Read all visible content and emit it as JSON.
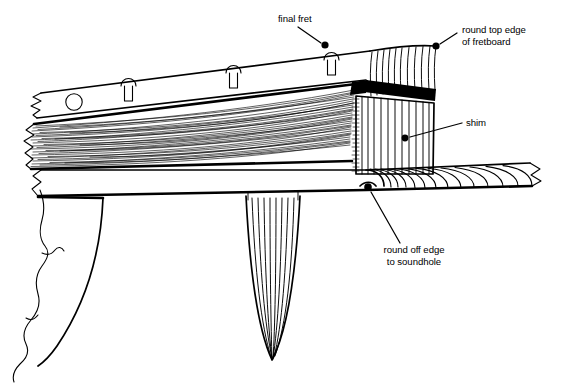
{
  "figure": {
    "view": "side elevation cutaway",
    "background_color": "#ffffff",
    "ink_color": "#000000",
    "width": 562,
    "height": 385
  },
  "callouts": [
    {
      "id": "final-fret",
      "label": "final fret",
      "lines": [
        "final fret"
      ],
      "text_x": 278,
      "text_y": 22,
      "anchor": "start",
      "leader": {
        "x1": 298,
        "y1": 27,
        "x2": 321,
        "y2": 43
      },
      "dot": {
        "cx": 325,
        "cy": 45,
        "r": 3.6
      }
    },
    {
      "id": "round-top-edge-of-fretboard",
      "label": "round top edge of fretboard",
      "lines": [
        "round top edge",
        "of fretboard"
      ],
      "text_x": 462,
      "text_y": 33,
      "anchor": "start",
      "leader": {
        "x1": 457,
        "y1": 33,
        "x2": 440,
        "y2": 44
      },
      "dot": {
        "cx": 436,
        "cy": 46,
        "r": 3.6
      }
    },
    {
      "id": "shim",
      "label": "shim",
      "lines": [
        "shim"
      ],
      "text_x": 466,
      "text_y": 126,
      "anchor": "start",
      "leader": {
        "x1": 462,
        "y1": 123,
        "x2": 410,
        "y2": 137
      },
      "dot": {
        "cx": 405,
        "cy": 138,
        "r": 3.4
      }
    },
    {
      "id": "round-off-edge-to-soundhole",
      "label": "round off edge to soundhole",
      "lines": [
        "round off edge",
        "to soundhole"
      ],
      "text_x": 414,
      "text_y": 253,
      "anchor": "middle",
      "leader": {
        "x1": 400,
        "y1": 243,
        "x2": 371,
        "y2": 192
      },
      "dot": {
        "cx": 368,
        "cy": 187,
        "r": 3.8
      }
    }
  ],
  "parts": [
    {
      "id": "neck-shaft",
      "name": "neck shaft with horizontal grain"
    },
    {
      "id": "fretboard",
      "name": "fretboard"
    },
    {
      "id": "frets",
      "name": "frets",
      "count": 3
    },
    {
      "id": "fret-marker-dot",
      "name": "side position marker dot"
    },
    {
      "id": "fretboard-end",
      "name": "rounded fretboard end grain"
    },
    {
      "id": "shim-block",
      "name": "shim block under fretboard extension"
    },
    {
      "id": "soundboard",
      "name": "soundboard / top"
    },
    {
      "id": "brace",
      "name": "tapered transverse brace"
    },
    {
      "id": "heel",
      "name": "neck heel profile"
    },
    {
      "id": "break-lines",
      "name": "break lines",
      "count": 4
    }
  ]
}
